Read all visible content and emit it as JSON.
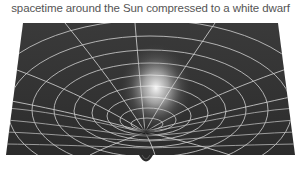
{
  "figure": {
    "title": "spacetime around the Sun compressed to a white dwarf",
    "colors": {
      "background": "#ffffff",
      "surface": "#333333",
      "surface_edge": "#2a2a2a",
      "grid_lines": "#c8c8c8",
      "glow": "#ffffff",
      "title_text": "#555555"
    }
  }
}
